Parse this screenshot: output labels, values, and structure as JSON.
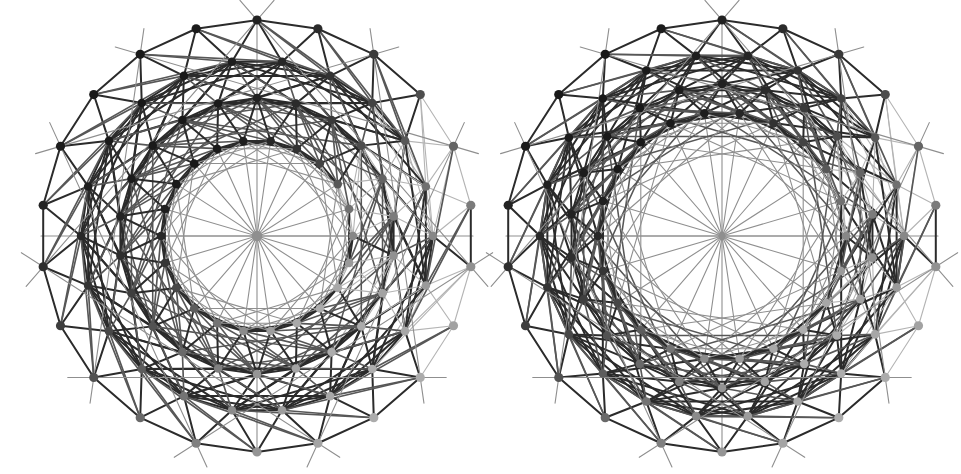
{
  "page": {
    "background": "#ffffff",
    "width": 961,
    "height": 474
  },
  "style": {
    "edge_dark": "#2b2b2b",
    "edge_mid": "#575757",
    "edge_light": "#8f8f8f",
    "edge_faint": "#b4b4b4",
    "vertex_darkest": "#111111",
    "vertex_lightest": "#dcdcdc",
    "edge_width_main": 2.0,
    "edge_width_thin": 1.1,
    "vertex_radius": 4.6
  },
  "chart_data": {
    "type": "diagram",
    "panels": [
      {
        "name": "left-projection",
        "center": [
          257,
          236
        ],
        "outer_radius": 216,
        "symmetry_order": 22,
        "hub_spokes": 22,
        "hub_hole_radius": 0,
        "rings": [
          {
            "radius": 216,
            "count": 22,
            "phase": 0.0
          },
          {
            "radius": 176,
            "count": 22,
            "phase": 0.5
          },
          {
            "radius": 138,
            "count": 22,
            "phase": 0.0
          },
          {
            "radius": 96,
            "count": 22,
            "phase": 0.5
          }
        ],
        "chord_steps": [
          1,
          2,
          3,
          5
        ],
        "vertex_count": 88
      },
      {
        "name": "right-projection",
        "center": [
          722,
          236
        ],
        "outer_radius": 216,
        "symmetry_order": 22,
        "hub_spokes": 22,
        "hub_hole_radius": 124,
        "rings": [
          {
            "radius": 216,
            "count": 22,
            "phase": 0.0
          },
          {
            "radius": 182,
            "count": 22,
            "phase": 0.5
          },
          {
            "radius": 152,
            "count": 22,
            "phase": 0.0
          },
          {
            "radius": 124,
            "count": 22,
            "phase": 0.5
          }
        ],
        "chord_steps": [
          1,
          2,
          3,
          6
        ],
        "vertex_count": 88
      }
    ],
    "depth_shading": {
      "note": "vertex gray level varies with angular position",
      "darkest_angle_deg": 90,
      "lightest_angle_deg": 0,
      "min_gray": 17,
      "max_gray": 220
    },
    "xlabel": "",
    "ylabel": "",
    "legend": [],
    "grid": false
  }
}
